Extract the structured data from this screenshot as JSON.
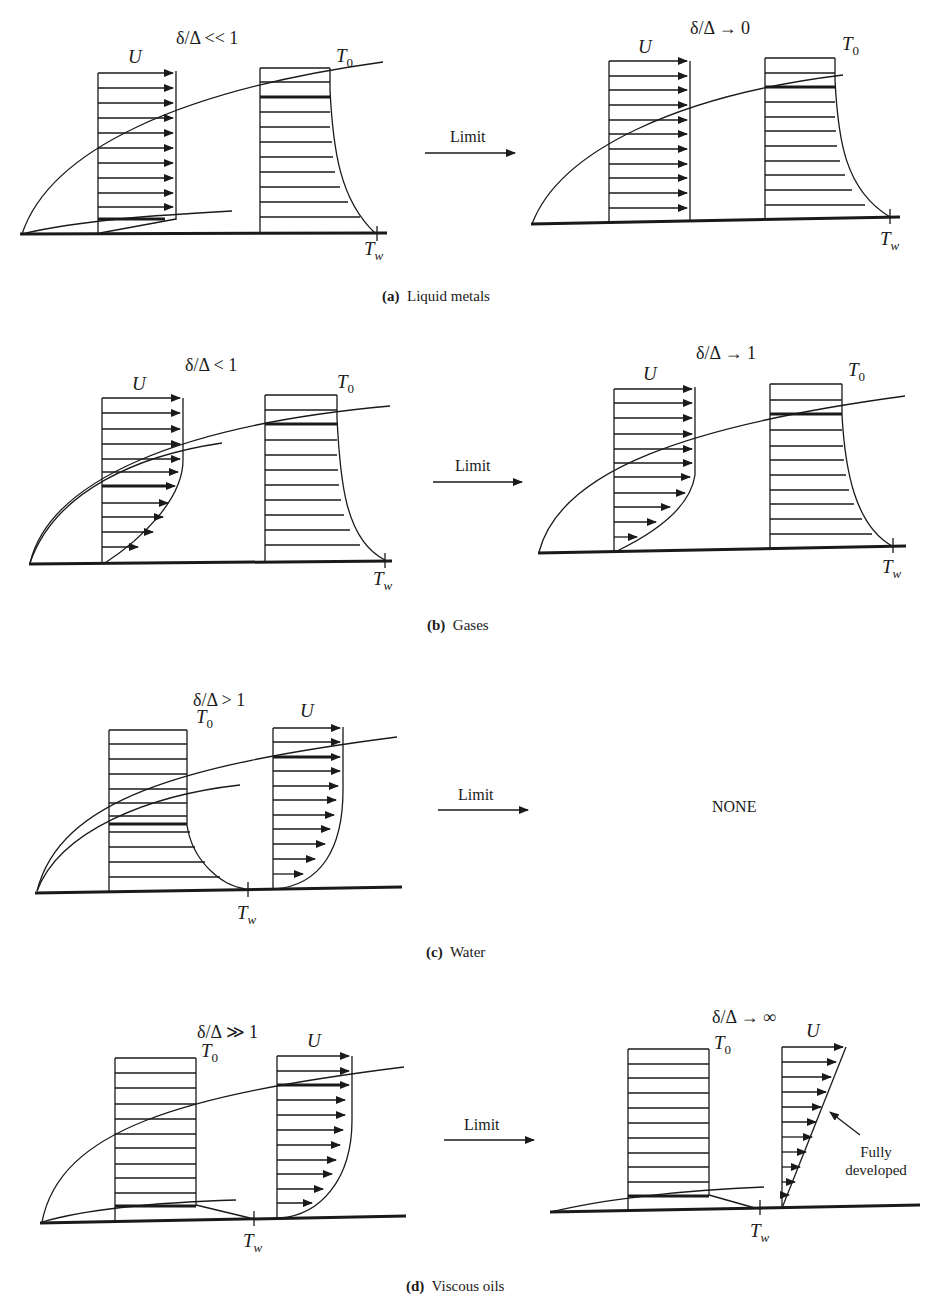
{
  "figure": {
    "panels": [
      {
        "id": "a",
        "caption_letter": "(a)",
        "caption_text": "Liquid metals",
        "left_ratio": "δ/Δ << 1",
        "limit_label": "Limit",
        "right_ratio": "δ/Δ → 0",
        "labels": {
          "U": "U",
          "T0": "T",
          "T0_sub": "0",
          "Tw": "T",
          "Tw_sub": "w"
        }
      },
      {
        "id": "b",
        "caption_letter": "(b)",
        "caption_text": "Gases",
        "left_ratio": "δ/Δ < 1",
        "limit_label": "Limit",
        "right_ratio": "δ/Δ → 1",
        "labels": {
          "U": "U",
          "T0": "T",
          "T0_sub": "0",
          "Tw": "T",
          "Tw_sub": "w"
        }
      },
      {
        "id": "c",
        "caption_letter": "(c)",
        "caption_text": "Water",
        "left_ratio": "δ/Δ > 1",
        "limit_label": "Limit",
        "right_result": "NONE",
        "labels": {
          "U": "U",
          "T0": "T",
          "T0_sub": "0",
          "Tw": "T",
          "Tw_sub": "w"
        }
      },
      {
        "id": "d",
        "caption_letter": "(d)",
        "caption_text": "Viscous oils",
        "left_ratio": "δ/Δ ≫ 1",
        "limit_label": "Limit",
        "right_ratio": "δ/Δ → ∞",
        "annotation": [
          "Fully",
          "developed"
        ],
        "labels": {
          "U": "U",
          "T0": "T",
          "T0_sub": "0",
          "Tw": "T",
          "Tw_sub": "w"
        }
      }
    ]
  }
}
